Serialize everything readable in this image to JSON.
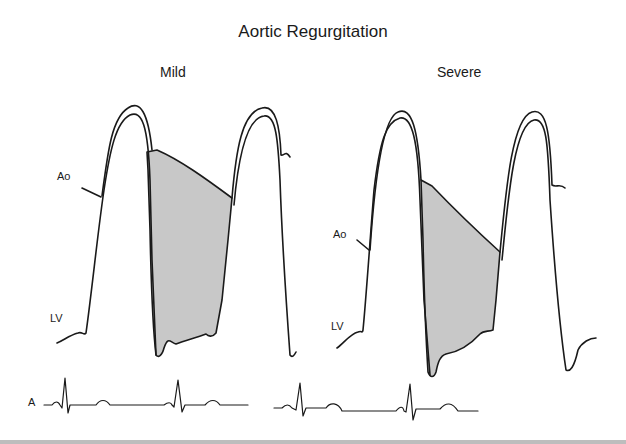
{
  "figure": {
    "title": "Aortic Regurgitation",
    "panels": [
      {
        "id": "mild",
        "label": "Mild",
        "trace_labels": {
          "aorta": "Ao",
          "ventricle": "LV"
        }
      },
      {
        "id": "severe",
        "label": "Severe",
        "trace_labels": {
          "aorta": "Ao",
          "ventricle": "LV"
        }
      }
    ],
    "ecg_label": "A",
    "colors": {
      "line": "#1a1a1a",
      "shade": "#c8c8c8",
      "background": "#ffffff",
      "rule": "#bdbdbd"
    }
  }
}
